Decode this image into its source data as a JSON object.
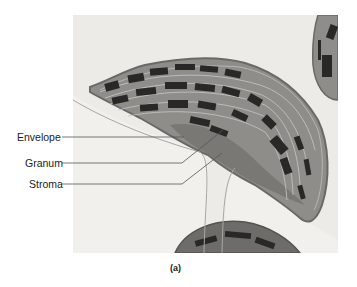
{
  "figure": {
    "type": "electron-micrograph",
    "caption": "(a)",
    "labels": [
      {
        "text": "Envelope"
      },
      {
        "text": "Granum"
      },
      {
        "text": "Stroma"
      }
    ],
    "colors": {
      "background": "#ffffff",
      "micrograph_bg": "#ecebe8",
      "stroma": "#8f8d89",
      "grana": "#2a2826",
      "envelope": "#6b6966",
      "leader_line": "#555555"
    }
  }
}
